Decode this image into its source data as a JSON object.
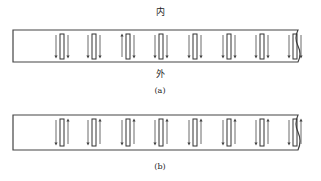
{
  "panel_a": {
    "label_top": "内",
    "label_bottom": "外",
    "caption": "(a)",
    "elements": [
      {
        "left": "down",
        "right": "down"
      },
      {
        "left": "down",
        "right": "down"
      },
      {
        "left": "up",
        "right": "down"
      },
      {
        "left": "down",
        "right": "down"
      },
      {
        "left": "down",
        "right": "down"
      },
      {
        "left": "down",
        "right": "down"
      },
      {
        "left": "down",
        "right": "down"
      },
      {
        "left": "down",
        "right": "down"
      }
    ]
  },
  "panel_b": {
    "caption": "(b)",
    "elements": [
      {
        "left": "down",
        "right": "up"
      },
      {
        "left": "down",
        "right": "up"
      },
      {
        "left": "down",
        "right": "up"
      },
      {
        "left": "down",
        "right": "up"
      },
      {
        "left": "down",
        "right": "up"
      },
      {
        "left": "down",
        "right": "up"
      },
      {
        "left": "down",
        "right": "up"
      },
      {
        "left": "down",
        "right": "up"
      }
    ]
  },
  "colors": {
    "stroke": "#333333",
    "arrow": "#444444"
  }
}
